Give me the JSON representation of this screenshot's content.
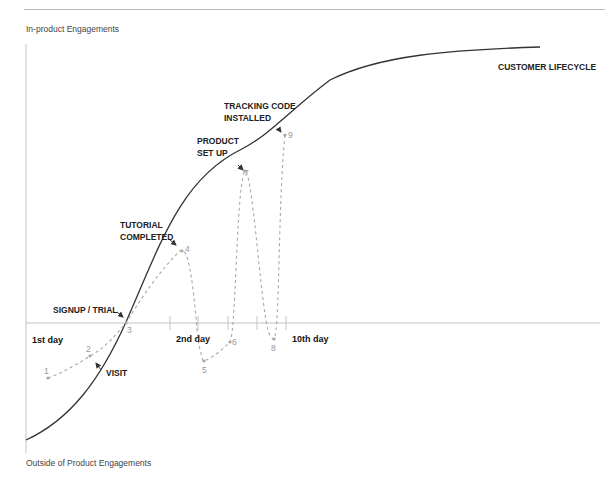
{
  "header": {
    "top_label": "In-product Engagements",
    "bottom_label": "Outside of Product Engagements"
  },
  "curve_label": "CUSTOMER LIFECYCLE",
  "milestones": [
    {
      "lines": [
        "VISIT"
      ]
    },
    {
      "lines": [
        "SIGNUP / TRIAL"
      ]
    },
    {
      "lines": [
        "TUTORIAL",
        "COMPLETED"
      ]
    },
    {
      "lines": [
        "PRODUCT",
        "SET UP"
      ]
    },
    {
      "lines": [
        "TRACKING CODE",
        "INSTALLED"
      ]
    }
  ],
  "days": [
    "1st day",
    "2nd day",
    "10th day"
  ],
  "points": [
    "1",
    "2",
    "3",
    "4",
    "5",
    "6",
    "7",
    "8",
    "9"
  ],
  "colors": {
    "curve": "#333333",
    "dashed": "#a8a8a8",
    "axis": "#c4c4c4"
  }
}
